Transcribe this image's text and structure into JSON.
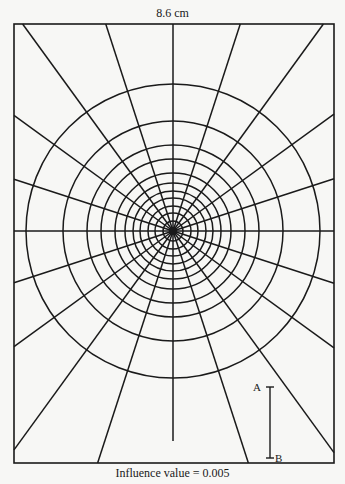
{
  "diagram": {
    "title": "8.6 cm",
    "caption": "Influence value = 0.005",
    "type": "Newmark influence chart",
    "frame": {
      "left": 14,
      "top": 24,
      "right": 334,
      "bottom": 463
    },
    "center": {
      "x": 173,
      "y": 231
    },
    "circle_radii_px": [
      10,
      18,
      25,
      33,
      40,
      48,
      58,
      72,
      86,
      110,
      147
    ],
    "ray_count": 20,
    "ray_angle_step_deg": 18,
    "down_ray_end_y": 441,
    "scale_bar": {
      "label_top": "A",
      "label_bottom": "B",
      "x": 270,
      "y_top": 387,
      "y_bottom": 458
    },
    "line_color": "#1a1a1a"
  }
}
